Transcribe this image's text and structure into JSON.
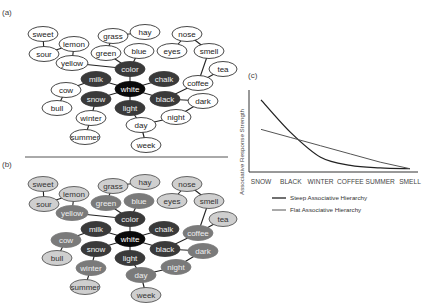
{
  "panels": {
    "a": {
      "label": "(a)"
    },
    "b": {
      "label": "(b)"
    },
    "c": {
      "label": "(c)"
    }
  },
  "colors": {
    "edge": "#222222",
    "node_white_fill": "#ffffff",
    "shade_black": "#0a0a0a",
    "shade_dark": "#3a3a3a",
    "shade_mid": "#7a7a7a",
    "shade_light": "#cfcfcf",
    "separator": "#555555"
  },
  "network": {
    "nodes": [
      {
        "id": "sweet",
        "label": "sweet",
        "x": 43,
        "y": 34,
        "rx": 15,
        "shade_a": "outline",
        "shade_b": "light"
      },
      {
        "id": "sour",
        "label": "sour",
        "x": 44,
        "y": 54,
        "rx": 15,
        "shade_a": "outline",
        "shade_b": "light"
      },
      {
        "id": "lemon",
        "label": "lemon",
        "x": 74,
        "y": 44,
        "rx": 15,
        "shade_a": "outline",
        "shade_b": "light"
      },
      {
        "id": "yellow",
        "label": "yellow",
        "x": 72,
        "y": 63,
        "rx": 16,
        "shade_a": "outline",
        "shade_b": "mid"
      },
      {
        "id": "grass",
        "label": "grass",
        "x": 113,
        "y": 36,
        "rx": 15,
        "shade_a": "outline",
        "shade_b": "light"
      },
      {
        "id": "hay",
        "label": "hay",
        "x": 145,
        "y": 32,
        "rx": 15,
        "shade_a": "outline",
        "shade_b": "light"
      },
      {
        "id": "green",
        "label": "green",
        "x": 106,
        "y": 53,
        "rx": 15,
        "shade_a": "outline",
        "shade_b": "mid"
      },
      {
        "id": "blue",
        "label": "blue",
        "x": 139,
        "y": 51,
        "rx": 15,
        "shade_a": "outline",
        "shade_b": "mid"
      },
      {
        "id": "nose",
        "label": "nose",
        "x": 187,
        "y": 34,
        "rx": 15,
        "shade_a": "outline",
        "shade_b": "light"
      },
      {
        "id": "eyes",
        "label": "eyes",
        "x": 172,
        "y": 51,
        "rx": 15,
        "shade_a": "outline",
        "shade_b": "light"
      },
      {
        "id": "smell",
        "label": "smell",
        "x": 209,
        "y": 51,
        "rx": 15,
        "shade_a": "outline",
        "shade_b": "light"
      },
      {
        "id": "tea",
        "label": "tea",
        "x": 223,
        "y": 69,
        "rx": 14,
        "shade_a": "outline",
        "shade_b": "light"
      },
      {
        "id": "color",
        "label": "color",
        "x": 130,
        "y": 69,
        "rx": 15,
        "shade_a": "dark",
        "shade_b": "dark"
      },
      {
        "id": "milk",
        "label": "milk",
        "x": 96,
        "y": 79,
        "rx": 15,
        "shade_a": "dark",
        "shade_b": "dark"
      },
      {
        "id": "chalk",
        "label": "chalk",
        "x": 164,
        "y": 79,
        "rx": 15,
        "shade_a": "dark",
        "shade_b": "dark"
      },
      {
        "id": "white",
        "label": "white",
        "x": 130,
        "y": 89,
        "rx": 15,
        "shade_a": "black",
        "shade_b": "black"
      },
      {
        "id": "cow",
        "label": "cow",
        "x": 66,
        "y": 90,
        "rx": 15,
        "shade_a": "outline",
        "shade_b": "mid"
      },
      {
        "id": "snow",
        "label": "snow",
        "x": 96,
        "y": 99,
        "rx": 15,
        "shade_a": "dark",
        "shade_b": "dark"
      },
      {
        "id": "coffee",
        "label": "coffee",
        "x": 198,
        "y": 83,
        "rx": 15,
        "shade_a": "outline",
        "shade_b": "mid"
      },
      {
        "id": "black",
        "label": "black",
        "x": 165,
        "y": 99,
        "rx": 15,
        "shade_a": "dark",
        "shade_b": "dark"
      },
      {
        "id": "bull",
        "label": "bull",
        "x": 57,
        "y": 108,
        "rx": 15,
        "shade_a": "outline",
        "shade_b": "light"
      },
      {
        "id": "light",
        "label": "light",
        "x": 130,
        "y": 108,
        "rx": 15,
        "shade_a": "dark",
        "shade_b": "dark"
      },
      {
        "id": "dark",
        "label": "dark",
        "x": 203,
        "y": 101,
        "rx": 15,
        "shade_a": "outline",
        "shade_b": "mid"
      },
      {
        "id": "winter",
        "label": "winter",
        "x": 91,
        "y": 118,
        "rx": 15,
        "shade_a": "outline",
        "shade_b": "mid"
      },
      {
        "id": "night",
        "label": "night",
        "x": 176,
        "y": 117,
        "rx": 15,
        "shade_a": "outline",
        "shade_b": "mid"
      },
      {
        "id": "day",
        "label": "day",
        "x": 141,
        "y": 125,
        "rx": 15,
        "shade_a": "outline",
        "shade_b": "mid"
      },
      {
        "id": "summer",
        "label": "summer",
        "x": 85,
        "y": 137,
        "rx": 15,
        "shade_a": "outline",
        "shade_b": "light"
      },
      {
        "id": "week",
        "label": "week",
        "x": 146,
        "y": 145,
        "rx": 15,
        "shade_a": "outline",
        "shade_b": "light"
      }
    ],
    "edges": [
      [
        "sweet",
        "sour"
      ],
      [
        "sour",
        "lemon"
      ],
      [
        "lemon",
        "yellow"
      ],
      [
        "yellow",
        "color"
      ],
      [
        "grass",
        "hay"
      ],
      [
        "grass",
        "green"
      ],
      [
        "green",
        "color"
      ],
      [
        "blue",
        "color"
      ],
      [
        "nose",
        "eyes"
      ],
      [
        "nose",
        "smell"
      ],
      [
        "smell",
        "coffee"
      ],
      [
        "tea",
        "coffee"
      ],
      [
        "color",
        "white"
      ],
      [
        "milk",
        "white"
      ],
      [
        "chalk",
        "white"
      ],
      [
        "white",
        "light"
      ],
      [
        "white",
        "snow"
      ],
      [
        "white",
        "black"
      ],
      [
        "milk",
        "cow"
      ],
      [
        "cow",
        "bull"
      ],
      [
        "snow",
        "winter"
      ],
      [
        "winter",
        "summer"
      ],
      [
        "black",
        "coffee"
      ],
      [
        "black",
        "dark"
      ],
      [
        "dark",
        "night"
      ],
      [
        "night",
        "day"
      ],
      [
        "light",
        "day"
      ],
      [
        "day",
        "week"
      ]
    ],
    "panel_b_offset_y": 150
  },
  "chart_data": {
    "type": "line",
    "title": "",
    "xlabel": "",
    "ylabel": "Associative Response Strength",
    "categories": [
      "SNOW",
      "BLACK",
      "WINTER",
      "COFFEE",
      "SUMMER",
      "SMELL"
    ],
    "ylim": [
      0,
      1
    ],
    "grid": false,
    "legend_position": "bottom",
    "series": [
      {
        "name": "Steep Associative Hierarchy",
        "values": [
          0.88,
          0.48,
          0.18,
          0.08,
          0.05,
          0.04
        ],
        "color": "#222222"
      },
      {
        "name": "Flat Associative Hierarchy",
        "values": [
          0.52,
          0.42,
          0.32,
          0.22,
          0.12,
          0.04
        ],
        "color": "#555555"
      }
    ]
  }
}
